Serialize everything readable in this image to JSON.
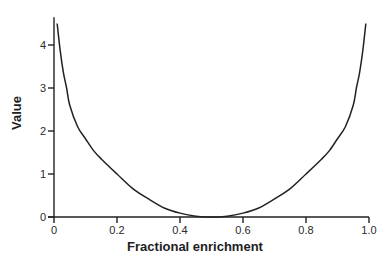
{
  "chart_data": {
    "type": "line",
    "title": "",
    "xlabel": "Fractional enrichment",
    "ylabel": "Value",
    "xlim": [
      0,
      1.0
    ],
    "ylim": [
      0,
      4.6
    ],
    "x_ticks": [
      "0",
      "0.2",
      "0.4",
      "0.6",
      "0.8",
      "1.0"
    ],
    "y_ticks": [
      "0",
      "1",
      "2",
      "3",
      "4"
    ],
    "grid": false,
    "legend": null,
    "series": [
      {
        "name": "curve",
        "color": "#222222",
        "x": [
          0.01,
          0.02,
          0.03,
          0.04,
          0.05,
          0.075,
          0.1,
          0.125,
          0.15,
          0.2,
          0.25,
          0.3,
          0.35,
          0.4,
          0.45,
          0.5,
          0.55,
          0.6,
          0.65,
          0.7,
          0.75,
          0.8,
          0.85,
          0.875,
          0.9,
          0.925,
          0.95,
          0.96,
          0.97,
          0.98,
          0.99
        ],
        "values": [
          4.5,
          3.85,
          3.35,
          3.0,
          2.6,
          2.1,
          1.82,
          1.55,
          1.35,
          1.0,
          0.66,
          0.42,
          0.21,
          0.09,
          0.02,
          0.0,
          0.02,
          0.09,
          0.21,
          0.42,
          0.66,
          1.0,
          1.35,
          1.55,
          1.82,
          2.1,
          2.6,
          3.0,
          3.35,
          3.85,
          4.5
        ]
      }
    ]
  }
}
